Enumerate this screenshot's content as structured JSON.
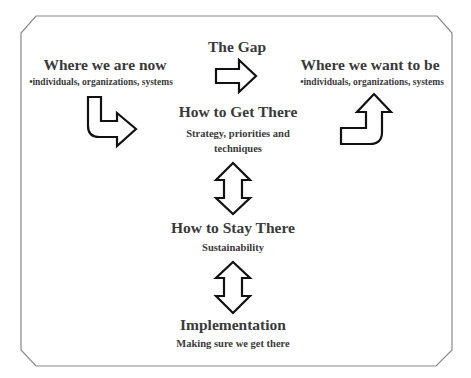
{
  "diagram": {
    "nodes": {
      "current": {
        "title": "Where we are now",
        "subtitle": "•individuals, organizations, systems"
      },
      "gap": {
        "title": "The Gap"
      },
      "target": {
        "title": "Where we want  to be",
        "subtitle": "•individuals, organizations, systems"
      },
      "how_get": {
        "title": "How to Get There",
        "line1": "Strategy, priorities and",
        "line2": "techniques"
      },
      "how_stay": {
        "title": "How to Stay There",
        "subtitle": "Sustainability"
      },
      "implementation": {
        "title": "Implementation",
        "subtitle": "Making sure we get there"
      }
    },
    "arrows": [
      {
        "name": "gap-right-arrow",
        "direction": "right"
      },
      {
        "name": "bent-down-right-arrow",
        "direction": "down-right"
      },
      {
        "name": "bent-right-up-arrow",
        "direction": "right-up"
      },
      {
        "name": "vertical-double-arrow-1",
        "direction": "up-down"
      },
      {
        "name": "vertical-double-arrow-2",
        "direction": "up-down"
      }
    ],
    "colors": {
      "stroke": "#111111",
      "text": "#3a3a3a",
      "frame": "#888888"
    }
  }
}
